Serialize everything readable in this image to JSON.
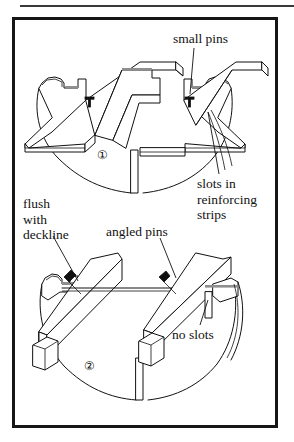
{
  "figure": {
    "title": "",
    "frame": {
      "border_color": "#161616",
      "background": "#ffffff"
    },
    "top_rule_color": "#3a3a3a",
    "line_color": "#111111"
  },
  "labels": {
    "small_pins": "small pins",
    "slots_in_reinforcing_strips": "slots in\nreinforcing\nstrips",
    "flush_with_deckline": "flush\nwith\ndeckline",
    "angled_pins": "angled pins",
    "no_slots": "no slots"
  },
  "figure_numbers": {
    "one": "①",
    "two": "②"
  },
  "icons": {
    "straight_pin": "straight-pin-icon",
    "angled_pin": "angled-pin-icon",
    "leader_line": "leader-line-icon"
  },
  "panels": [
    {
      "number": "①",
      "description": "Deck with reinforcing strips laid flat, slots cut in strips, small pins driven straight down",
      "callouts": [
        "small pins",
        "slots in reinforcing strips"
      ]
    },
    {
      "number": "②",
      "description": "Deck with square beams, no slots, pins driven at an angle, strip flush with deckline",
      "callouts": [
        "flush with deckline",
        "angled pins",
        "no slots"
      ]
    }
  ]
}
